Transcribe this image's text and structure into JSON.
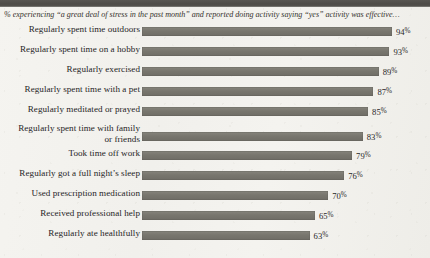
{
  "subtitle": "% experiencing “a great deal of stress in the past month” and reported doing activity saying “yes” activity was effective…",
  "colors": {
    "bar": "#78766e",
    "paper": "#f3f2ee",
    "header_band": "#4e4c48",
    "text": "#26241f"
  },
  "chart_data": {
    "type": "bar",
    "title": "",
    "subtitle": "% experiencing “a great deal of stress in the past month” and reported doing activity saying “yes” activity was effective…",
    "xlabel": "",
    "ylabel": "",
    "orientation": "horizontal",
    "grid": false,
    "legend": "none",
    "xlim": [
      0,
      100
    ],
    "value_suffix": "%",
    "categories": [
      "Regularly spent time outdoors",
      "Regularly spent time on a hobby",
      "Regularly exercised",
      "Regularly spent time with a pet",
      "Regularly meditated or prayed",
      "Regularly spent time with family or friends",
      "Took time off work",
      "Regularly got a full night’s sleep",
      "Used prescription medication",
      "Received professional help",
      "Regularly ate healthfully"
    ],
    "values": [
      94,
      93,
      89,
      87,
      85,
      83,
      79,
      76,
      70,
      65,
      63
    ],
    "value_labels": [
      "94%",
      "93%",
      "89%",
      "87%",
      "85%",
      "83%",
      "79%",
      "76%",
      "70%",
      "65%",
      "63%"
    ]
  },
  "rows": [
    {
      "label_line1": "Regularly spent time outdoors",
      "label_line2": "",
      "value": 94,
      "value_num": "94",
      "pct": "%"
    },
    {
      "label_line1": "Regularly spent time on a hobby",
      "label_line2": "",
      "value": 93,
      "value_num": "93",
      "pct": "%"
    },
    {
      "label_line1": "Regularly exercised",
      "label_line2": "",
      "value": 89,
      "value_num": "89",
      "pct": "%"
    },
    {
      "label_line1": "Regularly spent time with a pet",
      "label_line2": "",
      "value": 87,
      "value_num": "87",
      "pct": "%"
    },
    {
      "label_line1": "Regularly meditated or prayed",
      "label_line2": "",
      "value": 85,
      "value_num": "85",
      "pct": "%"
    },
    {
      "label_line1": "Regularly spent time with family",
      "label_line2": "or friends",
      "value": 83,
      "value_num": "83",
      "pct": "%"
    },
    {
      "label_line1": "Took time off work",
      "label_line2": "",
      "value": 79,
      "value_num": "79",
      "pct": "%"
    },
    {
      "label_line1": "Regularly got a full night’s sleep",
      "label_line2": "",
      "value": 76,
      "value_num": "76",
      "pct": "%"
    },
    {
      "label_line1": "Used prescription medication",
      "label_line2": "",
      "value": 70,
      "value_num": "70",
      "pct": "%"
    },
    {
      "label_line1": "Received professional help",
      "label_line2": "",
      "value": 65,
      "value_num": "65",
      "pct": "%"
    },
    {
      "label_line1": "Regularly ate healthfully",
      "label_line2": "",
      "value": 63,
      "value_num": "63",
      "pct": "%"
    }
  ]
}
